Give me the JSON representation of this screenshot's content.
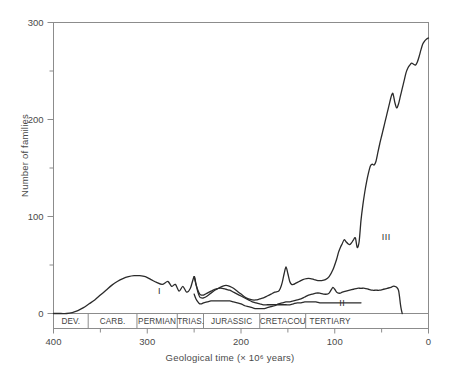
{
  "chart_data": {
    "type": "line",
    "title": "",
    "xlabel": "Geological time (× 10⁶ years)",
    "ylabel": "Number of families",
    "xlim": [
      400,
      0
    ],
    "ylim": [
      0,
      300
    ],
    "x_ticks": [
      400,
      300,
      200,
      100,
      0
    ],
    "x_tick_labels": [
      "400",
      "300",
      "200",
      "100",
      "0"
    ],
    "x_minor_ticks": [
      350,
      250,
      150,
      50
    ],
    "y_ticks": [
      0,
      100,
      200,
      300
    ],
    "y_tick_labels": [
      "0",
      "100",
      "200",
      "300"
    ],
    "y_minor_ticks": [
      50,
      150,
      250
    ],
    "grid": false,
    "legend": "none",
    "annotations": [
      {
        "text": "I",
        "x": 287,
        "y": 22
      },
      {
        "text": "II",
        "x": 92,
        "y": 10
      },
      {
        "text": "III",
        "x": 45,
        "y": 78
      }
    ],
    "period_bands": [
      {
        "label": "DEV.",
        "start": 400,
        "end": 363
      },
      {
        "label": "CARB.",
        "start": 363,
        "end": 311
      },
      {
        "label": "PERMIAN",
        "start": 311,
        "end": 268
      },
      {
        "label": "TRIAS.",
        "start": 268,
        "end": 240
      },
      {
        "label": "JURASSIC",
        "start": 240,
        "end": 180
      },
      {
        "label": "CRETACOUS",
        "start": 180,
        "end": 131
      },
      {
        "label": "TERTIARY",
        "start": 131,
        "end": 79
      }
    ],
    "series": [
      {
        "name": "total-marine-families",
        "points": [
          [
            400,
            0
          ],
          [
            392,
            0
          ],
          [
            386,
            0
          ],
          [
            380,
            1
          ],
          [
            374,
            3
          ],
          [
            368,
            6
          ],
          [
            362,
            10
          ],
          [
            356,
            14
          ],
          [
            350,
            19
          ],
          [
            344,
            24
          ],
          [
            338,
            29
          ],
          [
            332,
            33
          ],
          [
            326,
            36
          ],
          [
            320,
            38
          ],
          [
            314,
            39
          ],
          [
            308,
            39
          ],
          [
            302,
            38
          ],
          [
            296,
            35
          ],
          [
            290,
            32
          ],
          [
            284,
            30
          ],
          [
            278,
            33
          ],
          [
            274,
            28
          ],
          [
            270,
            30
          ],
          [
            266,
            23
          ],
          [
            262,
            28
          ],
          [
            258,
            22
          ],
          [
            254,
            26
          ],
          [
            250,
            38
          ],
          [
            248,
            30
          ],
          [
            246,
            22
          ],
          [
            244,
            17
          ],
          [
            242,
            16
          ],
          [
            240,
            16
          ],
          [
            236,
            18
          ],
          [
            232,
            21
          ],
          [
            228,
            24
          ],
          [
            224,
            26
          ],
          [
            220,
            28
          ],
          [
            216,
            29
          ],
          [
            212,
            28
          ],
          [
            208,
            26
          ],
          [
            204,
            23
          ],
          [
            200,
            20
          ],
          [
            196,
            17
          ],
          [
            192,
            15
          ],
          [
            188,
            14
          ],
          [
            184,
            14
          ],
          [
            180,
            15
          ],
          [
            176,
            16
          ],
          [
            172,
            18
          ],
          [
            168,
            20
          ],
          [
            164,
            22
          ],
          [
            160,
            23
          ],
          [
            158,
            26
          ],
          [
            156,
            32
          ],
          [
            154,
            41
          ],
          [
            152,
            48
          ],
          [
            150,
            41
          ],
          [
            148,
            33
          ],
          [
            146,
            30
          ],
          [
            144,
            30
          ],
          [
            142,
            31
          ],
          [
            138,
            33
          ],
          [
            134,
            35
          ],
          [
            130,
            36
          ],
          [
            126,
            36
          ],
          [
            122,
            35
          ],
          [
            118,
            34
          ],
          [
            114,
            34
          ],
          [
            110,
            35
          ],
          [
            106,
            38
          ],
          [
            102,
            45
          ],
          [
            98,
            56
          ],
          [
            96,
            63
          ],
          [
            94,
            68
          ],
          [
            92,
            72
          ],
          [
            90,
            76
          ],
          [
            88,
            74
          ],
          [
            86,
            72
          ],
          [
            84,
            71
          ],
          [
            82,
            73
          ],
          [
            80,
            76
          ],
          [
            78,
            78
          ],
          [
            76,
            68
          ],
          [
            74,
            74
          ],
          [
            72,
            96
          ],
          [
            70,
            112
          ],
          [
            68,
            125
          ],
          [
            66,
            136
          ],
          [
            64,
            145
          ],
          [
            62,
            152
          ],
          [
            60,
            154
          ],
          [
            58,
            153
          ],
          [
            56,
            157
          ],
          [
            54,
            166
          ],
          [
            52,
            175
          ],
          [
            50,
            183
          ],
          [
            48,
            191
          ],
          [
            46,
            199
          ],
          [
            44,
            207
          ],
          [
            42,
            215
          ],
          [
            40,
            223
          ],
          [
            38,
            227
          ],
          [
            36,
            218
          ],
          [
            34,
            212
          ],
          [
            32,
            216
          ],
          [
            30,
            224
          ],
          [
            28,
            232
          ],
          [
            26,
            240
          ],
          [
            24,
            248
          ],
          [
            22,
            253
          ],
          [
            20,
            256
          ],
          [
            18,
            258
          ],
          [
            16,
            257
          ],
          [
            14,
            256
          ],
          [
            12,
            259
          ],
          [
            10,
            265
          ],
          [
            8,
            272
          ],
          [
            6,
            278
          ],
          [
            4,
            281
          ],
          [
            2,
            283
          ],
          [
            0,
            284
          ]
        ]
      },
      {
        "name": "modern-fauna",
        "points": [
          [
            250,
            20
          ],
          [
            248,
            15
          ],
          [
            246,
            12
          ],
          [
            244,
            10
          ],
          [
            242,
            10
          ],
          [
            240,
            11
          ],
          [
            236,
            12
          ],
          [
            232,
            13
          ],
          [
            228,
            13
          ],
          [
            224,
            13
          ],
          [
            220,
            13
          ],
          [
            216,
            13
          ],
          [
            212,
            13
          ],
          [
            208,
            12
          ],
          [
            204,
            11
          ],
          [
            200,
            10
          ],
          [
            196,
            8
          ],
          [
            192,
            7
          ],
          [
            188,
            6
          ],
          [
            184,
            5
          ],
          [
            180,
            5
          ],
          [
            176,
            5
          ],
          [
            172,
            6
          ],
          [
            168,
            7
          ],
          [
            164,
            8
          ],
          [
            160,
            10
          ],
          [
            156,
            11
          ],
          [
            152,
            12
          ],
          [
            148,
            12
          ],
          [
            144,
            13
          ],
          [
            140,
            14
          ],
          [
            136,
            15
          ],
          [
            132,
            17
          ],
          [
            128,
            19
          ],
          [
            124,
            20
          ],
          [
            120,
            21
          ],
          [
            116,
            21
          ],
          [
            112,
            20
          ],
          [
            108,
            20
          ],
          [
            106,
            21
          ],
          [
            104,
            24
          ],
          [
            102,
            27
          ],
          [
            100,
            25
          ],
          [
            98,
            22
          ],
          [
            96,
            21
          ],
          [
            94,
            21
          ],
          [
            92,
            22
          ],
          [
            88,
            23
          ],
          [
            84,
            24
          ],
          [
            80,
            25
          ],
          [
            76,
            26
          ],
          [
            72,
            26
          ],
          [
            68,
            26
          ],
          [
            64,
            25
          ],
          [
            60,
            24
          ],
          [
            56,
            24
          ],
          [
            52,
            24
          ],
          [
            48,
            25
          ],
          [
            44,
            26
          ],
          [
            40,
            27
          ],
          [
            38,
            28
          ],
          [
            36,
            28
          ],
          [
            34,
            27
          ],
          [
            32,
            24
          ],
          [
            31,
            18
          ],
          [
            30,
            10
          ],
          [
            29,
            4
          ],
          [
            28,
            0
          ]
        ]
      },
      {
        "name": "paleozoic-fauna",
        "points": [
          [
            250,
            38
          ],
          [
            248,
            30
          ],
          [
            246,
            24
          ],
          [
            244,
            20
          ],
          [
            242,
            19
          ],
          [
            240,
            19
          ],
          [
            236,
            21
          ],
          [
            232,
            23
          ],
          [
            228,
            25
          ],
          [
            224,
            26
          ],
          [
            220,
            26
          ],
          [
            216,
            25
          ],
          [
            212,
            24
          ],
          [
            208,
            22
          ],
          [
            204,
            20
          ],
          [
            200,
            18
          ],
          [
            196,
            16
          ],
          [
            192,
            14
          ],
          [
            188,
            12
          ],
          [
            184,
            11
          ],
          [
            180,
            10
          ],
          [
            176,
            9
          ],
          [
            172,
            9
          ],
          [
            168,
            9
          ],
          [
            164,
            9
          ],
          [
            160,
            9
          ],
          [
            156,
            9
          ],
          [
            152,
            9
          ],
          [
            148,
            9
          ],
          [
            144,
            10
          ],
          [
            140,
            11
          ],
          [
            136,
            11
          ],
          [
            132,
            12
          ],
          [
            128,
            12
          ],
          [
            124,
            12
          ],
          [
            120,
            12
          ],
          [
            116,
            11
          ],
          [
            112,
            11
          ],
          [
            108,
            11
          ],
          [
            104,
            11
          ],
          [
            100,
            11
          ],
          [
            96,
            11
          ],
          [
            92,
            11
          ],
          [
            88,
            11
          ],
          [
            84,
            11
          ],
          [
            80,
            11
          ],
          [
            76,
            11
          ],
          [
            72,
            11
          ]
        ]
      }
    ]
  },
  "styles": {
    "line_color": "#2b2b2b",
    "axis_color": "#8c8c8c",
    "text_color": "#4a4a4a",
    "background": "#ffffff"
  }
}
